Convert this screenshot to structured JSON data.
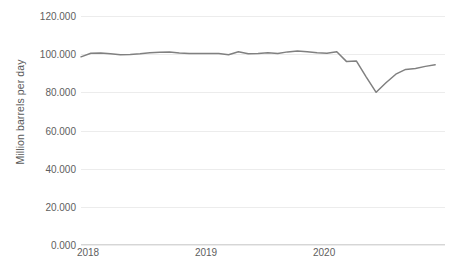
{
  "chart_data": {
    "type": "line",
    "title": "",
    "xlabel": "",
    "ylabel": "Million barrels per day",
    "ylim": [
      0,
      120
    ],
    "ytick_labels": [
      "0.000",
      "20.000",
      "40.000",
      "60.000",
      "80.000",
      "100.000",
      "120.000"
    ],
    "ytick_values": [
      0,
      20,
      40,
      60,
      80,
      100,
      120
    ],
    "xtick_labels": [
      "2018",
      "2019",
      "2020"
    ],
    "xtick_positions": [
      0,
      12,
      24
    ],
    "grid": true,
    "legend": "none",
    "line_color": "#808080",
    "line_width": 1.5,
    "x": [
      "2018-01",
      "2018-02",
      "2018-03",
      "2018-04",
      "2018-05",
      "2018-06",
      "2018-07",
      "2018-08",
      "2018-09",
      "2018-10",
      "2018-11",
      "2018-12",
      "2019-01",
      "2019-02",
      "2019-03",
      "2019-04",
      "2019-05",
      "2019-06",
      "2019-07",
      "2019-08",
      "2019-09",
      "2019-10",
      "2019-11",
      "2019-12",
      "2020-01",
      "2020-02",
      "2020-03",
      "2020-04",
      "2020-05",
      "2020-06",
      "2020-07",
      "2020-08",
      "2020-09",
      "2020-10",
      "2020-11"
    ],
    "values": [
      98.6,
      100.5,
      100.6,
      100.2,
      99.7,
      99.8,
      100.2,
      100.8,
      101.0,
      101.1,
      100.6,
      100.3,
      100.4,
      100.3,
      100.4,
      99.7,
      101.3,
      100.2,
      100.4,
      100.8,
      100.3,
      101.2,
      101.6,
      101.3,
      100.7,
      100.5,
      101.3,
      96.1,
      96.4,
      88.0,
      80.0,
      85.0,
      89.5,
      92.0,
      92.5
    ],
    "values_tail": [
      93.6,
      94.4
    ],
    "series_name": "World oil supply"
  },
  "axis": {
    "y_title": "Million barrels per day"
  },
  "footer": {
    "caption": ""
  }
}
